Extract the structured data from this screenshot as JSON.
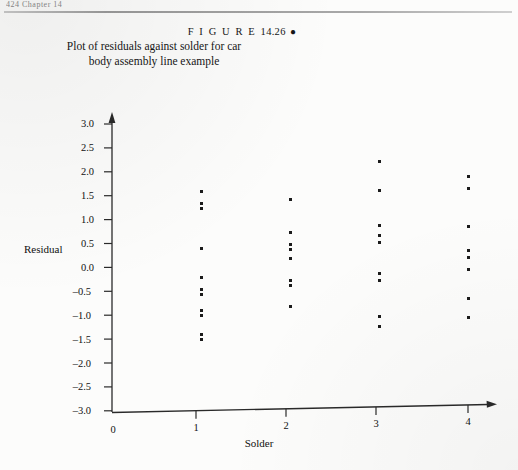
{
  "page": {
    "running_head": "424   Chapter 14",
    "background_color": "#fcfcfb",
    "ink_color": "#1a1a1a"
  },
  "caption": {
    "figure_word": "F I G U R E",
    "figure_number": "14.26",
    "bullet": "●",
    "line1": "Plot of residuals against solder for car",
    "line2": "body assembly line example"
  },
  "chart_data": {
    "type": "scatter",
    "title": "Plot of residuals against solder for car body assembly line example",
    "xlabel": "Solder",
    "ylabel": "Residual",
    "xlim": [
      0,
      4.45
    ],
    "ylim": [
      -3.0,
      3.0
    ],
    "grid": false,
    "legend": "none",
    "xticks": [
      0,
      1,
      2,
      3,
      4
    ],
    "xtick_labels": [
      "0",
      "1",
      "2",
      "3",
      "4"
    ],
    "yticks": [
      3.0,
      2.5,
      2.0,
      1.5,
      1.0,
      0.5,
      0.0,
      -0.5,
      -1.0,
      -1.5,
      -2.0,
      -2.5,
      -3.0
    ],
    "ytick_labels": [
      "3.0",
      "2.5",
      "2.0",
      "1.5",
      "1.0",
      "0.5",
      "0.0",
      "–0.5",
      "–1.0",
      "–1.5",
      "–2.0",
      "–2.5",
      "–3.0"
    ],
    "marker": "square",
    "marker_color": "#1b1b1b",
    "marker_size_px": 3,
    "series": [
      {
        "name": "residuals",
        "points": [
          {
            "x": 1,
            "y": 1.55
          },
          {
            "x": 1,
            "y": 1.3
          },
          {
            "x": 1,
            "y": 1.2
          },
          {
            "x": 1,
            "y": 0.35
          },
          {
            "x": 1,
            "y": -0.25
          },
          {
            "x": 1,
            "y": -0.5
          },
          {
            "x": 1,
            "y": -0.6
          },
          {
            "x": 1,
            "y": -0.95
          },
          {
            "x": 1,
            "y": -1.05
          },
          {
            "x": 1,
            "y": -1.45
          },
          {
            "x": 1,
            "y": -1.55
          },
          {
            "x": 2,
            "y": 1.35
          },
          {
            "x": 2,
            "y": 0.65
          },
          {
            "x": 2,
            "y": 0.4
          },
          {
            "x": 2,
            "y": 0.3
          },
          {
            "x": 2,
            "y": 0.1
          },
          {
            "x": 2,
            "y": -0.35
          },
          {
            "x": 2,
            "y": -0.45
          },
          {
            "x": 2,
            "y": -0.9
          },
          {
            "x": 3,
            "y": 2.1
          },
          {
            "x": 3,
            "y": 1.5
          },
          {
            "x": 3,
            "y": 0.75
          },
          {
            "x": 3,
            "y": 0.55
          },
          {
            "x": 3,
            "y": 0.4
          },
          {
            "x": 3,
            "y": -0.25
          },
          {
            "x": 3,
            "y": -0.4
          },
          {
            "x": 3,
            "y": -1.15
          },
          {
            "x": 3,
            "y": -1.35
          },
          {
            "x": 4,
            "y": 1.75
          },
          {
            "x": 4,
            "y": 1.5
          },
          {
            "x": 4,
            "y": 0.7
          },
          {
            "x": 4,
            "y": 0.2
          },
          {
            "x": 4,
            "y": 0.05
          },
          {
            "x": 4,
            "y": -0.2
          },
          {
            "x": 4,
            "y": -0.8
          },
          {
            "x": 4,
            "y": -1.2
          }
        ]
      }
    ]
  }
}
